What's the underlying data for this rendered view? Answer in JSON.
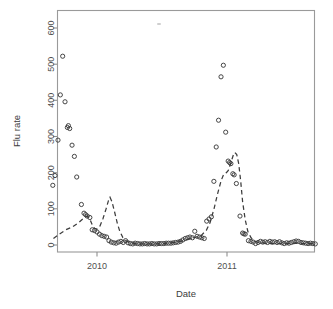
{
  "figure": {
    "title": "",
    "background": "#ffffff",
    "frame_color": "#9a9a9a",
    "point_color": "#3c3c3c",
    "line_color": "#3c3c3c"
  },
  "axes": {
    "ylabel": "Flu rate",
    "xlabel": "Date",
    "y_ticks": [
      "0",
      "100",
      "200",
      "300",
      "400",
      "500",
      "600"
    ],
    "x_ticks": [
      "2010",
      "2011"
    ]
  },
  "chart_data": {
    "type": "scatter",
    "title": "",
    "xlabel": "Date",
    "ylabel": "Flu rate",
    "xlim": [
      2009.62,
      2011.72
    ],
    "ylim": [
      -18,
      660
    ],
    "grid": false,
    "legend": null,
    "x_tick_values": [
      2010,
      2011
    ],
    "x_tick_labels": [
      "2010",
      "2011"
    ],
    "y_tick_values": [
      0,
      100,
      200,
      300,
      400,
      500,
      600
    ],
    "y_tick_labels": [
      "0",
      "100",
      "200",
      "300",
      "400",
      "500",
      "600"
    ],
    "series": [
      {
        "name": "observed",
        "type": "scatter",
        "marker": "open-circle",
        "color": "#3c3c3c",
        "points": [
          [
            2009.66,
            165
          ],
          [
            2009.677,
            192
          ],
          [
            2009.7,
            290
          ],
          [
            2009.718,
            415
          ],
          [
            2009.736,
            522
          ],
          [
            2009.754,
            396
          ],
          [
            2009.772,
            325
          ],
          [
            2009.78,
            330
          ],
          [
            2009.79,
            322
          ],
          [
            2009.808,
            276
          ],
          [
            2009.826,
            245
          ],
          [
            2009.844,
            188
          ],
          [
            2009.88,
            112
          ],
          [
            2009.9,
            88
          ],
          [
            2009.912,
            84
          ],
          [
            2009.925,
            80
          ],
          [
            2009.945,
            76
          ],
          [
            2009.963,
            42
          ],
          [
            2009.981,
            40
          ],
          [
            2010.0,
            36
          ],
          [
            2010.019,
            30
          ],
          [
            2010.037,
            26
          ],
          [
            2010.055,
            24
          ],
          [
            2010.074,
            22
          ],
          [
            2010.092,
            12
          ],
          [
            2010.11,
            8
          ],
          [
            2010.129,
            6
          ],
          [
            2010.147,
            5
          ],
          [
            2010.165,
            8
          ],
          [
            2010.184,
            10
          ],
          [
            2010.202,
            7
          ],
          [
            2010.22,
            12
          ],
          [
            2010.239,
            6
          ],
          [
            2010.257,
            4
          ],
          [
            2010.275,
            3
          ],
          [
            2010.294,
            5
          ],
          [
            2010.312,
            4
          ],
          [
            2010.33,
            3
          ],
          [
            2010.349,
            3
          ],
          [
            2010.367,
            4
          ],
          [
            2010.385,
            3
          ],
          [
            2010.404,
            3
          ],
          [
            2010.422,
            4
          ],
          [
            2010.44,
            3
          ],
          [
            2010.459,
            3
          ],
          [
            2010.477,
            4
          ],
          [
            2010.495,
            4
          ],
          [
            2010.514,
            4
          ],
          [
            2010.532,
            5
          ],
          [
            2010.55,
            5
          ],
          [
            2010.569,
            5
          ],
          [
            2010.587,
            6
          ],
          [
            2010.605,
            7
          ],
          [
            2010.624,
            8
          ],
          [
            2010.642,
            10
          ],
          [
            2010.66,
            14
          ],
          [
            2010.679,
            18
          ],
          [
            2010.697,
            20
          ],
          [
            2010.715,
            22
          ],
          [
            2010.734,
            20
          ],
          [
            2010.752,
            38
          ],
          [
            2010.77,
            24
          ],
          [
            2010.789,
            22
          ],
          [
            2010.807,
            20
          ],
          [
            2010.825,
            18
          ],
          [
            2010.844,
            66
          ],
          [
            2010.862,
            72
          ],
          [
            2010.88,
            78
          ],
          [
            2010.899,
            176
          ],
          [
            2010.917,
            271
          ],
          [
            2010.935,
            345
          ],
          [
            2010.954,
            465
          ],
          [
            2010.972,
            497
          ],
          [
            2010.99,
            312
          ],
          [
            2011.009,
            232
          ],
          [
            2011.02,
            228
          ],
          [
            2011.03,
            225
          ],
          [
            2011.045,
            197
          ],
          [
            2011.055,
            194
          ],
          [
            2011.072,
            170
          ],
          [
            2011.1,
            80
          ],
          [
            2011.12,
            33
          ],
          [
            2011.13,
            31
          ],
          [
            2011.14,
            30
          ],
          [
            2011.165,
            12
          ],
          [
            2011.184,
            10
          ],
          [
            2011.202,
            8
          ],
          [
            2011.22,
            4
          ],
          [
            2011.239,
            7
          ],
          [
            2011.257,
            10
          ],
          [
            2011.275,
            8
          ],
          [
            2011.294,
            9
          ],
          [
            2011.312,
            7
          ],
          [
            2011.33,
            10
          ],
          [
            2011.349,
            8
          ],
          [
            2011.367,
            9
          ],
          [
            2011.385,
            7
          ],
          [
            2011.404,
            9
          ],
          [
            2011.422,
            6
          ],
          [
            2011.44,
            4
          ],
          [
            2011.459,
            6
          ],
          [
            2011.477,
            5
          ],
          [
            2011.495,
            7
          ],
          [
            2011.514,
            9
          ],
          [
            2011.532,
            11
          ],
          [
            2011.55,
            10
          ],
          [
            2011.569,
            7
          ],
          [
            2011.587,
            6
          ],
          [
            2011.605,
            5
          ],
          [
            2011.624,
            4
          ],
          [
            2011.642,
            5
          ],
          [
            2011.66,
            4
          ],
          [
            2011.679,
            3
          ]
        ]
      },
      {
        "name": "fitted",
        "type": "line",
        "style": "dashed",
        "color": "#3c3c3c",
        "points": [
          [
            2009.665,
            18
          ],
          [
            2009.71,
            30
          ],
          [
            2009.76,
            42
          ],
          [
            2009.81,
            50
          ],
          [
            2009.86,
            62
          ],
          [
            2009.9,
            75
          ],
          [
            2009.925,
            80
          ],
          [
            2009.945,
            72
          ],
          [
            2009.963,
            56
          ],
          [
            2009.981,
            46
          ],
          [
            2010.0,
            44
          ],
          [
            2010.02,
            50
          ],
          [
            2010.045,
            72
          ],
          [
            2010.07,
            100
          ],
          [
            2010.09,
            125
          ],
          [
            2010.1,
            132
          ],
          [
            2010.115,
            120
          ],
          [
            2010.135,
            92
          ],
          [
            2010.155,
            62
          ],
          [
            2010.175,
            38
          ],
          [
            2010.2,
            20
          ],
          [
            2010.23,
            10
          ],
          [
            2010.27,
            5
          ],
          [
            2010.33,
            3
          ],
          [
            2010.42,
            3
          ],
          [
            2010.52,
            4
          ],
          [
            2010.62,
            8
          ],
          [
            2010.7,
            16
          ],
          [
            2010.76,
            22
          ],
          [
            2010.8,
            26
          ],
          [
            2010.84,
            40
          ],
          [
            2010.87,
            62
          ],
          [
            2010.9,
            100
          ],
          [
            2010.93,
            145
          ],
          [
            2010.955,
            178
          ],
          [
            2010.975,
            196
          ],
          [
            2010.995,
            200
          ],
          [
            2011.01,
            206
          ],
          [
            2011.03,
            228
          ],
          [
            2011.048,
            248
          ],
          [
            2011.06,
            256
          ],
          [
            2011.075,
            250
          ],
          [
            2011.09,
            225
          ],
          [
            2011.105,
            178
          ],
          [
            2011.12,
            120
          ],
          [
            2011.14,
            70
          ],
          [
            2011.16,
            38
          ],
          [
            2011.185,
            20
          ],
          [
            2011.215,
            10
          ],
          [
            2011.26,
            6
          ],
          [
            2011.32,
            4
          ],
          [
            2011.4,
            4
          ],
          [
            2011.5,
            5
          ],
          [
            2011.6,
            4
          ],
          [
            2011.68,
            4
          ]
        ]
      }
    ]
  }
}
